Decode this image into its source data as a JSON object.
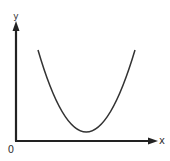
{
  "diagram": {
    "type": "function-graph",
    "axes": {
      "x_label": "x",
      "y_label": "y",
      "origin_label": "0"
    },
    "colors": {
      "axis": "#222222",
      "curve": "#333333",
      "label": "#333333",
      "background": "#ffffff"
    },
    "curve": {
      "shape": "parabola-opening-upward",
      "left_end": [
        38,
        50
      ],
      "vertex": [
        86,
        132
      ],
      "right_end": [
        135,
        50
      ]
    }
  }
}
